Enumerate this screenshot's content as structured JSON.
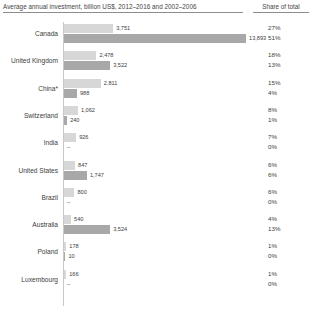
{
  "header": {
    "title": "Average annual investment, billion US$, 2012–2016 and 2002–2006",
    "share_header": "Share of total"
  },
  "chart_data": {
    "type": "bar",
    "title": "Average annual investment, billion US$, 2012–2016 and 2002–2006",
    "xlabel": "",
    "ylabel": "",
    "grid": false,
    "orientation": "horizontal",
    "legend_position": "none",
    "xlim": [
      0,
      14500
    ],
    "categories": [
      "Canada",
      "United Kingdom",
      "China*",
      "Switzerland",
      "India",
      "United States",
      "Brazil",
      "Australia",
      "Poland",
      "Luxembourg"
    ],
    "series": [
      {
        "name": "2012–2016",
        "values": [
          3751,
          2478,
          2811,
          1062,
          926,
          847,
          800,
          540,
          178,
          166
        ],
        "labels": [
          "3,751",
          "2,478",
          "2,811",
          "1,062",
          "926",
          "847",
          "800",
          "540",
          "178",
          "166"
        ],
        "shares": [
          "27%",
          "18%",
          "15%",
          "8%",
          "7%",
          "6%",
          "6%",
          "4%",
          "1%",
          "1%"
        ],
        "color": "#d7d7d7"
      },
      {
        "name": "2002–2006",
        "values": [
          13893,
          3522,
          988,
          240,
          0,
          1747,
          0,
          3524,
          10,
          0
        ],
        "labels": [
          "13,893",
          "3,522",
          "988",
          "240",
          "–",
          "1,747",
          "–",
          "3,524",
          "10",
          "–"
        ],
        "shares": [
          "51%",
          "13%",
          "4%",
          "1%",
          "0%",
          "6%",
          "0%",
          "13%",
          "0%",
          "0%"
        ],
        "color": "#a8a8a8"
      }
    ]
  }
}
